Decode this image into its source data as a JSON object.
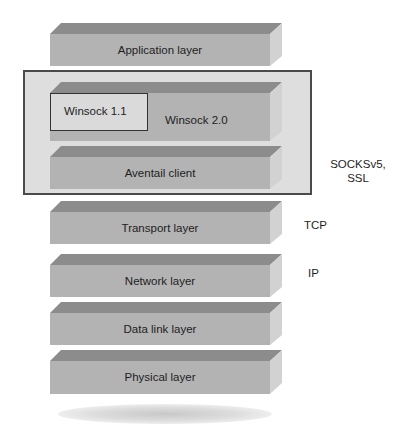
{
  "diagram": {
    "colors": {
      "top_face": "#8c8c8c",
      "front_face": "#b3b3b3",
      "side_face": "#d2d2d2",
      "group_box_bg": "#dedede",
      "group_box_border": "#4a4a4a",
      "text": "#1e1e1e"
    },
    "layers": [
      {
        "label": "Application layer"
      },
      {
        "label": "Winsock 2.0",
        "inner_box": "Winsock 1.1"
      },
      {
        "label": "Aventail client"
      },
      {
        "label": "Transport layer"
      },
      {
        "label": "Network layer"
      },
      {
        "label": "Data link layer"
      },
      {
        "label": "Physical layer"
      }
    ],
    "side_labels": {
      "socks": "SOCKSv5,",
      "ssl": "SSL",
      "tcp": "TCP",
      "ip": "IP"
    }
  }
}
